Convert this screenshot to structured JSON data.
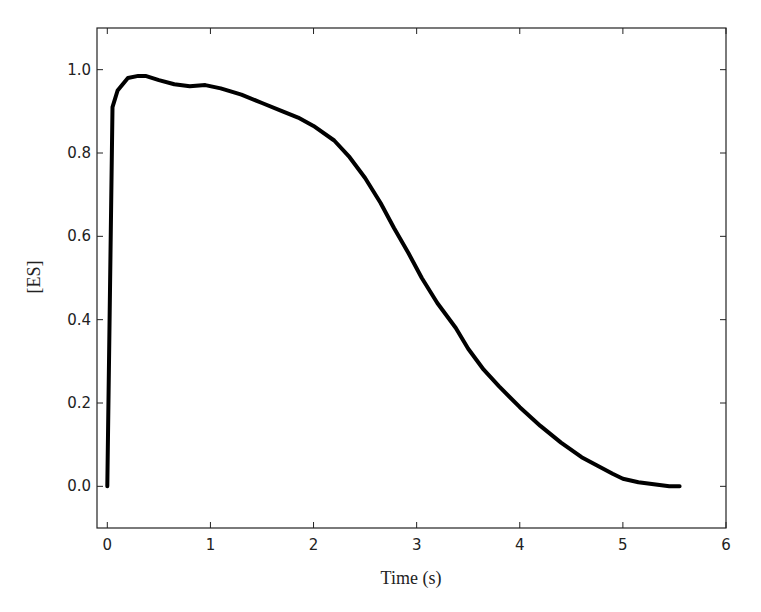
{
  "chart_data": {
    "type": "line",
    "title": "",
    "xlabel": "Time (s)",
    "ylabel": "[ES]",
    "xlim": [
      -0.1,
      6
    ],
    "ylim": [
      -0.1,
      1.1
    ],
    "xticks": [
      "0",
      "1",
      "2",
      "3",
      "4",
      "5",
      "6"
    ],
    "yticks": [
      "0.0",
      "0.2",
      "0.4",
      "0.6",
      "0.8",
      "1.0"
    ],
    "grid": false,
    "legend": null,
    "series": [
      {
        "name": "[ES]",
        "color": "#000000",
        "x": [
          0.0,
          0.05,
          0.1,
          0.2,
          0.3,
          0.37,
          0.5,
          0.65,
          0.8,
          0.95,
          1.1,
          1.3,
          1.5,
          1.7,
          1.85,
          2.0,
          2.2,
          2.35,
          2.5,
          2.65,
          2.78,
          2.92,
          3.05,
          3.2,
          3.38,
          3.5,
          3.65,
          3.8,
          4.0,
          4.2,
          4.4,
          4.6,
          4.75,
          4.9,
          5.0,
          5.15,
          5.3,
          5.45,
          5.55
        ],
        "y": [
          0.0,
          0.91,
          0.95,
          0.98,
          0.985,
          0.985,
          0.975,
          0.965,
          0.96,
          0.963,
          0.955,
          0.94,
          0.92,
          0.9,
          0.885,
          0.865,
          0.83,
          0.79,
          0.74,
          0.68,
          0.62,
          0.56,
          0.5,
          0.44,
          0.38,
          0.33,
          0.28,
          0.24,
          0.19,
          0.145,
          0.105,
          0.07,
          0.05,
          0.03,
          0.018,
          0.01,
          0.005,
          0.0,
          0.0
        ]
      }
    ]
  }
}
